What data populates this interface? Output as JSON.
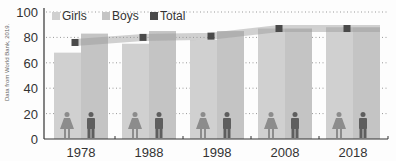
{
  "chart_data": {
    "type": "bar",
    "title": "",
    "xlabel": "",
    "ylabel": "",
    "ylim": [
      0,
      100
    ],
    "yticks": [
      0,
      20,
      40,
      60,
      80,
      100
    ],
    "grid": "dotted horizontal",
    "legend_position": "top-left inside",
    "categories": [
      "1978",
      "1988",
      "1998",
      "2008",
      "2018"
    ],
    "series": [
      {
        "name": "Girls",
        "type": "bar",
        "color": "#d0d0d0",
        "values": [
          68,
          75,
          78,
          87,
          88
        ]
      },
      {
        "name": "Boys",
        "type": "bar",
        "color": "#c4c4c4",
        "values": [
          83,
          85,
          85,
          87,
          88
        ]
      },
      {
        "name": "Total",
        "type": "line",
        "color": "#4a4a4a",
        "values": [
          76,
          80,
          81,
          87,
          87
        ]
      }
    ],
    "annotations": [
      "Data from World Bank, 2019."
    ]
  },
  "legend": {
    "items": [
      {
        "label": "Girls",
        "color": "#d0d0d0"
      },
      {
        "label": "Boys",
        "color": "#c4c4c4"
      },
      {
        "label": "Total",
        "color": "#4a4a4a"
      }
    ]
  },
  "source_note": "Data from World Bank, 2019.",
  "icons": {
    "girl": "female-figure-icon",
    "boy": "male-figure-icon"
  }
}
